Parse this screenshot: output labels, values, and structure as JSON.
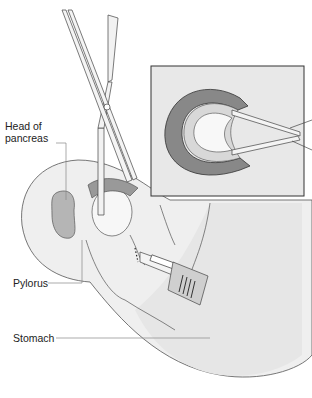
{
  "figure": {
    "labels": {
      "head_of_pancreas_line1": "Head of",
      "head_of_pancreas_line2": "pancreas",
      "pylorus": "Pylorus",
      "stomach": "Stomach"
    },
    "colors": {
      "outline": "#333333",
      "stomach_fill": "#efefef",
      "inset_bg": "#e8e8e8",
      "pancreas_fill": "#b0b0b0",
      "leader_line": "#888888"
    }
  }
}
